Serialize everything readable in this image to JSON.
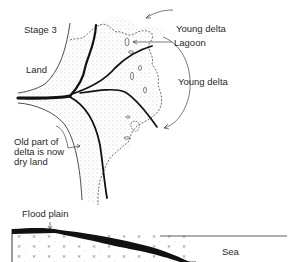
{
  "title": "Stage 3",
  "map_labels": {
    "land": "Land",
    "young_delta_top": "Young delta",
    "lagoon": "Lagoon",
    "young_delta_right": "Young delta",
    "old_part_line1": "Old part of",
    "old_part_line2": "delta is now",
    "old_part_line3": "dry land"
  },
  "section_labels": {
    "flood_plain": "Flood plain",
    "sea": "Sea"
  },
  "colors": {
    "ink": "#111111",
    "stipple": "#9a9a9a",
    "background": "#ffffff"
  }
}
